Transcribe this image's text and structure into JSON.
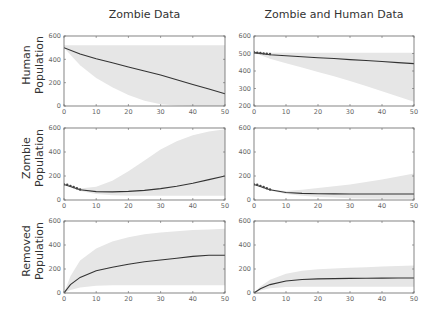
{
  "columns": [
    "Zombie Data",
    "Zombie and Human Data"
  ],
  "rows": [
    {
      "line1": "Human",
      "line2": "Population"
    },
    {
      "line1": "Zombie",
      "line2": "Population"
    },
    {
      "line1": "Removed",
      "line2": "Population"
    }
  ],
  "colors": {
    "band": "#e6e6e6",
    "line": "#333333",
    "axis": "#666666",
    "marker": "#444444"
  },
  "chart_data": [
    {
      "type": "line",
      "title": "Zombie Data",
      "ylabel": "Human Population",
      "xlabel": "",
      "xlim": [
        0,
        50
      ],
      "ylim": [
        0,
        600
      ],
      "xticks": [
        0,
        10,
        20,
        30,
        40,
        50
      ],
      "yticks": [
        0,
        200,
        400,
        600
      ],
      "x": [
        0,
        5,
        10,
        15,
        20,
        25,
        30,
        35,
        40,
        45,
        50
      ],
      "mean": [
        500,
        445,
        405,
        370,
        335,
        300,
        265,
        225,
        185,
        145,
        105
      ],
      "band_upper": [
        520,
        520,
        520,
        520,
        520,
        520,
        520,
        520,
        520,
        520,
        520
      ],
      "band_lower": [
        500,
        350,
        240,
        160,
        95,
        45,
        15,
        5,
        0,
        0,
        0
      ],
      "data_points": []
    },
    {
      "type": "line",
      "title": "Zombie and Human Data",
      "ylabel": "Human Population",
      "xlabel": "",
      "xlim": [
        0,
        50
      ],
      "ylim": [
        200,
        600
      ],
      "xticks": [
        0,
        10,
        20,
        30,
        40,
        50
      ],
      "yticks": [
        200,
        300,
        400,
        500,
        600
      ],
      "x": [
        0,
        5,
        10,
        15,
        20,
        25,
        30,
        35,
        40,
        45,
        50
      ],
      "mean": [
        505,
        493,
        487,
        481,
        476,
        471,
        465,
        460,
        454,
        448,
        442
      ],
      "band_upper": [
        505,
        505,
        505,
        505,
        505,
        505,
        505,
        505,
        505,
        505,
        505
      ],
      "band_lower": [
        505,
        470,
        445,
        420,
        395,
        370,
        343,
        315,
        285,
        255,
        225
      ],
      "data_points": [
        [
          0,
          507
        ],
        [
          1,
          505
        ],
        [
          2,
          503
        ],
        [
          3,
          501
        ],
        [
          4,
          499
        ],
        [
          5,
          497
        ]
      ]
    },
    {
      "type": "line",
      "title": "",
      "ylabel": "Zombie Population",
      "xlabel": "",
      "xlim": [
        0,
        50
      ],
      "ylim": [
        0,
        600
      ],
      "xticks": [
        0,
        10,
        20,
        30,
        40,
        50
      ],
      "yticks": [
        0,
        200,
        400,
        600
      ],
      "x": [
        0,
        5,
        10,
        15,
        20,
        25,
        30,
        35,
        40,
        45,
        50
      ],
      "mean": [
        130,
        85,
        70,
        68,
        72,
        80,
        95,
        115,
        140,
        170,
        200
      ],
      "band_upper": [
        130,
        95,
        110,
        160,
        240,
        330,
        420,
        490,
        540,
        570,
        590
      ],
      "band_lower": [
        130,
        75,
        50,
        40,
        35,
        35,
        35,
        35,
        35,
        35,
        35
      ],
      "data_points": [
        [
          0,
          130
        ],
        [
          1,
          128
        ],
        [
          2,
          118
        ],
        [
          3,
          108
        ],
        [
          4,
          98
        ],
        [
          5,
          88
        ]
      ]
    },
    {
      "type": "line",
      "title": "",
      "ylabel": "Zombie Population",
      "xlabel": "",
      "xlim": [
        0,
        50
      ],
      "ylim": [
        0,
        600
      ],
      "xticks": [
        0,
        10,
        20,
        30,
        40,
        50
      ],
      "yticks": [
        0,
        200,
        400,
        600
      ],
      "x": [
        0,
        5,
        10,
        15,
        20,
        25,
        30,
        35,
        40,
        45,
        50
      ],
      "mean": [
        130,
        85,
        62,
        55,
        52,
        51,
        50,
        50,
        50,
        50,
        50
      ],
      "band_upper": [
        130,
        90,
        75,
        85,
        100,
        115,
        130,
        150,
        170,
        195,
        220
      ],
      "band_lower": [
        130,
        80,
        50,
        35,
        25,
        20,
        15,
        12,
        10,
        10,
        10
      ],
      "data_points": [
        [
          0,
          130
        ],
        [
          1,
          128
        ],
        [
          2,
          118
        ],
        [
          3,
          108
        ],
        [
          4,
          98
        ],
        [
          5,
          88
        ]
      ]
    },
    {
      "type": "line",
      "title": "",
      "ylabel": "Removed Population",
      "xlabel": "",
      "xlim": [
        0,
        50
      ],
      "ylim": [
        0,
        600
      ],
      "xticks": [
        0,
        10,
        20,
        30,
        40,
        50
      ],
      "yticks": [
        0,
        200,
        400,
        600
      ],
      "x": [
        0,
        2,
        5,
        10,
        15,
        20,
        25,
        30,
        35,
        40,
        45,
        50
      ],
      "mean": [
        0,
        70,
        130,
        185,
        215,
        240,
        260,
        275,
        290,
        305,
        315,
        315
      ],
      "band_upper": [
        0,
        140,
        270,
        370,
        430,
        465,
        490,
        505,
        515,
        525,
        530,
        535
      ],
      "band_lower": [
        0,
        25,
        45,
        60,
        65,
        65,
        65,
        65,
        65,
        65,
        65,
        65
      ],
      "data_points": []
    },
    {
      "type": "line",
      "title": "",
      "ylabel": "Removed Population",
      "xlabel": "",
      "xlim": [
        0,
        50
      ],
      "ylim": [
        0,
        600
      ],
      "xticks": [
        0,
        10,
        20,
        30,
        40,
        50
      ],
      "yticks": [
        0,
        200,
        400,
        600
      ],
      "x": [
        0,
        2,
        5,
        10,
        15,
        20,
        25,
        30,
        35,
        40,
        45,
        50
      ],
      "mean": [
        0,
        35,
        70,
        100,
        112,
        118,
        120,
        122,
        123,
        124,
        125,
        125
      ],
      "band_upper": [
        0,
        55,
        110,
        160,
        185,
        198,
        205,
        210,
        215,
        220,
        225,
        230
      ],
      "band_lower": [
        0,
        20,
        40,
        50,
        52,
        52,
        52,
        52,
        52,
        52,
        52,
        52
      ],
      "data_points": []
    }
  ]
}
